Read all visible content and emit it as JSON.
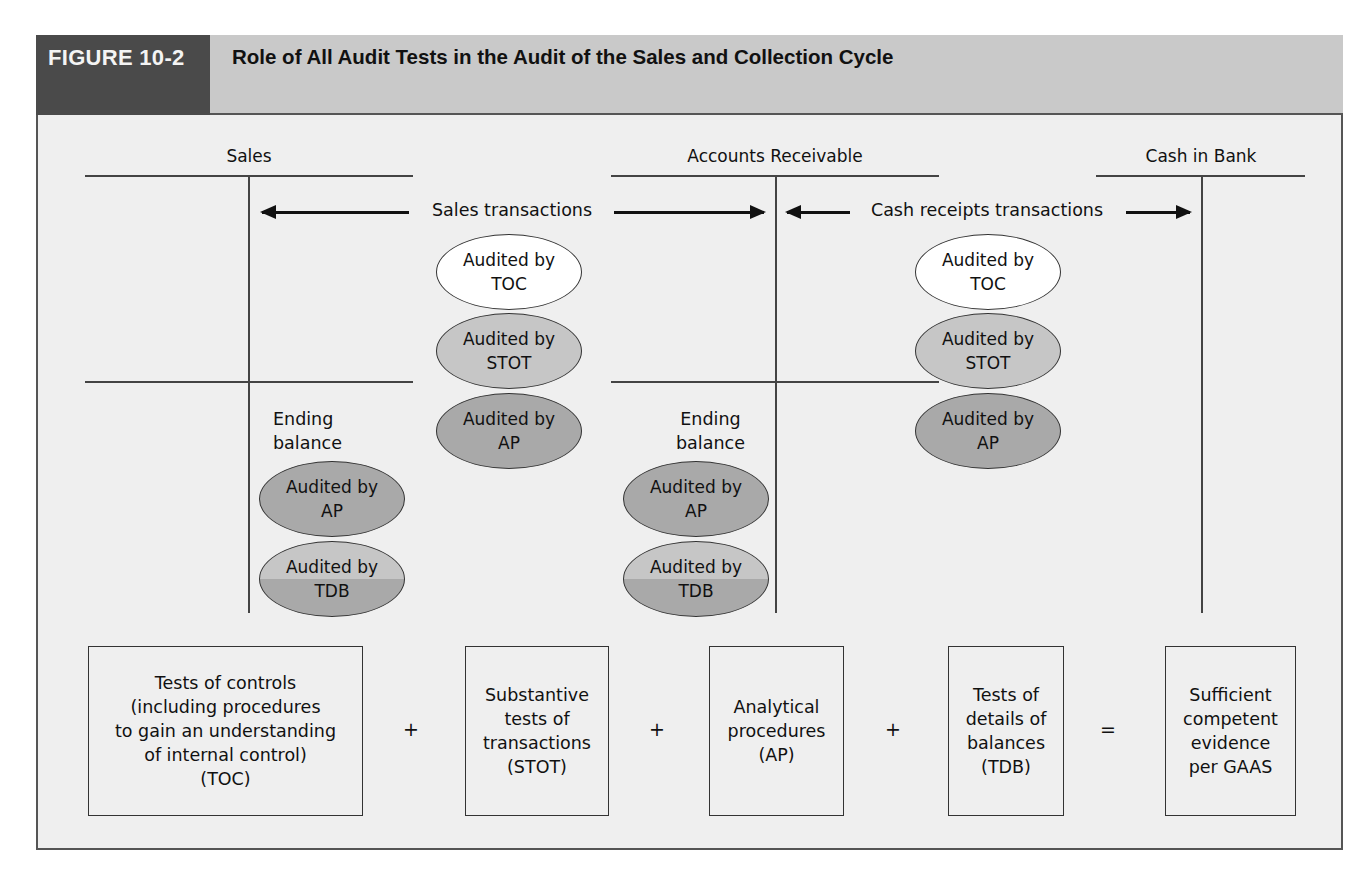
{
  "header": {
    "figure_label": "FIGURE 10-2",
    "title": "Role of All Audit Tests in the Audit of the Sales and Collection Cycle"
  },
  "accounts": [
    {
      "title": "Sales",
      "ending_balance_label": [
        "Ending",
        "balance"
      ]
    },
    {
      "title": "Accounts Receivable",
      "ending_balance_label": [
        "Ending",
        "balance"
      ]
    },
    {
      "title": "Cash in Bank"
    }
  ],
  "transactions": [
    {
      "label": "Sales transactions",
      "ellipses": [
        {
          "line1": "Audited by",
          "line2": "TOC",
          "type": "toc"
        },
        {
          "line1": "Audited by",
          "line2": "STOT",
          "type": "stot"
        },
        {
          "line1": "Audited by",
          "line2": "AP",
          "type": "ap"
        }
      ]
    },
    {
      "label": "Cash receipts transactions",
      "ellipses": [
        {
          "line1": "Audited by",
          "line2": "TOC",
          "type": "toc"
        },
        {
          "line1": "Audited by",
          "line2": "STOT",
          "type": "stot"
        },
        {
          "line1": "Audited by",
          "line2": "AP",
          "type": "ap"
        }
      ]
    }
  ],
  "ending_balance_ellipses": [
    {
      "line1": "Audited by",
      "line2": "AP",
      "type": "ap"
    },
    {
      "line1": "Audited by",
      "line2": "TDB",
      "type": "tdb"
    }
  ],
  "equation": {
    "boxes": [
      {
        "lines": [
          "Tests of controls",
          "(including procedures",
          "to gain an understanding",
          "of internal control)",
          "(TOC)"
        ]
      },
      {
        "lines": [
          "Substantive",
          "tests of",
          "transactions",
          "(STOT)"
        ]
      },
      {
        "lines": [
          "Analytical",
          "procedures",
          "(AP)"
        ]
      },
      {
        "lines": [
          "Tests of",
          "details of",
          "balances",
          "(TDB)"
        ]
      },
      {
        "lines": [
          "Sufficient",
          "competent",
          "evidence",
          "per GAAS"
        ]
      }
    ],
    "operators": [
      "+",
      "+",
      "+",
      "="
    ]
  },
  "colors": {
    "label_bg": "#4a4a4a",
    "title_bg": "#c9c9c9",
    "panel_bg": "#efefef",
    "toc_fill": "#ffffff",
    "stot_fill": "#c6c6c6",
    "ap_fill": "#a9a9a9"
  }
}
